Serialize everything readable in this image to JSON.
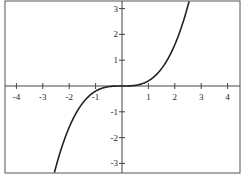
{
  "chart_data": {
    "type": "line",
    "title": "",
    "xlabel": "",
    "ylabel": "",
    "xlim": [
      -4.4,
      4.5
    ],
    "ylim": [
      -3.3,
      3.25
    ],
    "grid": false,
    "x_ticks": [
      -4,
      -3,
      -2,
      -1,
      1,
      2,
      3,
      4
    ],
    "y_ticks": [
      -3,
      -2,
      -1,
      1,
      2,
      3
    ],
    "x_tick_labels": [
      "-4",
      "-3",
      "-2",
      "-1",
      "1",
      "2",
      "3",
      "4"
    ],
    "y_tick_labels": [
      "-3",
      "-2",
      "-1",
      "1",
      "2",
      "3"
    ],
    "series": [
      {
        "name": "y = x^3/5",
        "x": [
          -2.5,
          -2,
          -1.5,
          -1,
          -0.5,
          0,
          0.5,
          1,
          1.5,
          2,
          2.5
        ],
        "y": [
          -3.125,
          -1.6,
          -0.675,
          -0.2,
          -0.025,
          0,
          0.025,
          0.2,
          0.675,
          1.6,
          3.125
        ]
      }
    ],
    "colors": {
      "curve": "#222222",
      "axes": "#444444",
      "frame": "#555555"
    }
  }
}
